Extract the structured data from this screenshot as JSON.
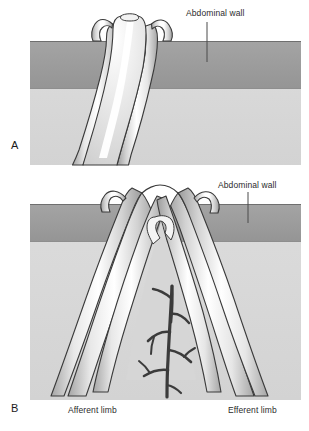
{
  "figure": {
    "type": "medical-illustration",
    "background_color": "#ffffff"
  },
  "colors": {
    "abdominal_wall_band": "#9d9d9d",
    "abdominal_wall_band_edge": "#6e6e6e",
    "subcutaneous_tissue": "#d9d9d9",
    "tissue_edge": "#8c8c8c",
    "bowel_fill": "#ffffff",
    "bowel_outline": "#3a3a3a",
    "bowel_shadow": "#b8b8b8",
    "mesenteric_vessel": "#3b3b3b",
    "label_text": "#2b2b2b"
  },
  "panels": [
    {
      "letter": "A",
      "name": "end-colostomy",
      "labels": {
        "abdominal_wall": "Abdominal wall"
      }
    },
    {
      "letter": "B",
      "name": "loop-colostomy",
      "labels": {
        "abdominal_wall": "Abdominal wall",
        "afferent_limb": "Afferent limb",
        "efferent_limb": "Efferent limb"
      }
    }
  ],
  "labels": {
    "abdominal_wall_a": "Abdominal wall",
    "abdominal_wall_b": "Abdominal wall",
    "afferent_limb": "Afferent limb",
    "efferent_limb": "Efferent limb",
    "letter_a": "A",
    "letter_b": "B"
  }
}
